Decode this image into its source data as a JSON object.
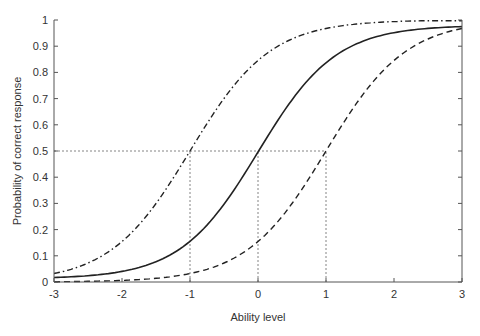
{
  "chart_data": {
    "type": "line",
    "title": "",
    "xlabel": "Ability level",
    "ylabel": "Probability of correct response",
    "xlim": [
      -3,
      3
    ],
    "ylim": [
      0,
      1
    ],
    "xticks": [
      -3,
      -2,
      -1,
      0,
      1,
      2,
      3
    ],
    "yticks": [
      0,
      0.1,
      0.2,
      0.3,
      0.4,
      0.5,
      0.6,
      0.7,
      0.8,
      0.9,
      1
    ],
    "ytick_labels": [
      "0",
      "0.1",
      "0.2",
      "0.3",
      "0.4",
      "0.5",
      "0.6",
      "0.7",
      "0.8",
      "0.9",
      "1"
    ],
    "xtick_labels": [
      "-3",
      "-2",
      "-1",
      "0",
      "1",
      "2",
      "3"
    ],
    "grid": false,
    "legend": null,
    "x": [
      -3,
      -2.5,
      -2,
      -1.5,
      -1,
      -0.5,
      0,
      0.5,
      1,
      1.5,
      2,
      2.5,
      3
    ],
    "series": [
      {
        "name": "Item difficulty -1 (dash-dot)",
        "style": "dashdot",
        "difficulty": -1,
        "values": [
          0.03,
          0.07,
          0.15,
          0.3,
          0.5,
          0.7,
          0.85,
          0.93,
          0.97,
          0.985,
          0.99,
          0.995,
          0.997
        ]
      },
      {
        "name": "Item difficulty 0 (solid)",
        "style": "solid",
        "difficulty": 0,
        "values": [
          0.015,
          0.02,
          0.04,
          0.08,
          0.16,
          0.3,
          0.5,
          0.7,
          0.84,
          0.92,
          0.96,
          0.975,
          0.98
        ]
      },
      {
        "name": "Item difficulty 1 (dashed)",
        "style": "dashed",
        "difficulty": 1,
        "values": [
          0.0,
          0.005,
          0.01,
          0.015,
          0.035,
          0.08,
          0.16,
          0.3,
          0.5,
          0.7,
          0.84,
          0.92,
          0.97
        ]
      }
    ],
    "reference_lines": [
      {
        "type": "horizontal",
        "y": 0.5,
        "x_from": -3,
        "x_to": 1,
        "style": "dotted"
      },
      {
        "type": "vertical",
        "x": -1,
        "y_from": 0,
        "y_to": 0.5,
        "style": "dotted"
      },
      {
        "type": "vertical",
        "x": 0,
        "y_from": 0,
        "y_to": 0.5,
        "style": "dotted"
      },
      {
        "type": "vertical",
        "x": 1,
        "y_from": 0,
        "y_to": 0.5,
        "style": "dotted"
      }
    ]
  }
}
